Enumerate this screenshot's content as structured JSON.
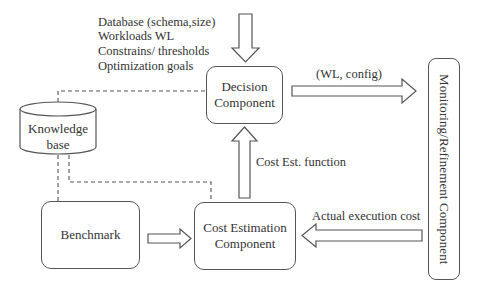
{
  "inputs": {
    "lines": [
      "Database (schema,size)",
      "Workloads WL",
      "Constrains/ thresholds",
      "Optimization goals"
    ]
  },
  "nodes": {
    "decision": {
      "line1": "Decision",
      "line2": "Component"
    },
    "knowledge_base": {
      "line1": "Knowledge",
      "line2": "base"
    },
    "benchmark": {
      "label": "Benchmark"
    },
    "cost_estimation": {
      "line1": "Cost Estimation",
      "line2": "Component"
    },
    "monitoring": {
      "label": "Monitoring/Refinement Component"
    }
  },
  "edges": {
    "decision_to_monitoring": "(WL, config)",
    "cost_to_decision": "Cost Est. function",
    "monitoring_to_cost": "Actual execution cost"
  },
  "colors": {
    "stroke": "#555555",
    "text": "#333333",
    "background": "#ffffff"
  }
}
